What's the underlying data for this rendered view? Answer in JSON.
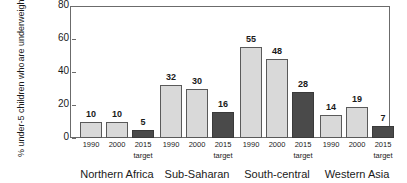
{
  "chart_data": {
    "type": "bar",
    "title": "",
    "xlabel": "",
    "ylabel_lines": [
      "% under-5 children who",
      "are underweight"
    ],
    "ylabel": "% under-5 children who are underweight",
    "ylim": [
      0,
      80
    ],
    "yticks": [
      0,
      20,
      40,
      60,
      80
    ],
    "ytick_labels": [
      "0",
      "20",
      "40",
      "60",
      "80"
    ],
    "grid": false,
    "legend": "none",
    "categories": [
      "Northern Africa",
      "Sub-Saharan",
      "South-central",
      "Western Asia"
    ],
    "series": [
      {
        "name": "1990",
        "style": "light",
        "values": [
          10,
          32,
          55,
          14
        ]
      },
      {
        "name": "2000",
        "style": "light",
        "values": [
          10,
          30,
          48,
          19
        ]
      },
      {
        "name": "2015 target",
        "style": "dark",
        "values": [
          5,
          16,
          28,
          7
        ]
      }
    ],
    "groups": [
      {
        "region": "Northern Africa",
        "bars": [
          {
            "tick": "1990",
            "sub": "",
            "value": 10,
            "style": "light"
          },
          {
            "tick": "2000",
            "sub": "",
            "value": 10,
            "style": "light"
          },
          {
            "tick": "2015",
            "sub": "target",
            "value": 5,
            "style": "dark"
          }
        ]
      },
      {
        "region": "Sub-Saharan",
        "bars": [
          {
            "tick": "1990",
            "sub": "",
            "value": 32,
            "style": "light"
          },
          {
            "tick": "2000",
            "sub": "",
            "value": 30,
            "style": "light"
          },
          {
            "tick": "2015",
            "sub": "target",
            "value": 16,
            "style": "dark"
          }
        ]
      },
      {
        "region": "South-central",
        "bars": [
          {
            "tick": "1990",
            "sub": "",
            "value": 55,
            "style": "light"
          },
          {
            "tick": "2000",
            "sub": "",
            "value": 48,
            "style": "light"
          },
          {
            "tick": "2015",
            "sub": "target",
            "value": 28,
            "style": "dark"
          }
        ]
      },
      {
        "region": "Western Asia",
        "bars": [
          {
            "tick": "1990",
            "sub": "",
            "value": 14,
            "style": "light"
          },
          {
            "tick": "2000",
            "sub": "",
            "value": 19,
            "style": "light"
          },
          {
            "tick": "2015",
            "sub": "target",
            "value": 7,
            "style": "dark"
          }
        ]
      }
    ],
    "colors": {
      "bar_light": "#d9d9d9",
      "bar_dark": "#4a4a4a",
      "bar_edge": "#5a5a5a",
      "axis": "#6b6b6b",
      "text": "#1a1a1a",
      "background": "#ffffff"
    }
  }
}
